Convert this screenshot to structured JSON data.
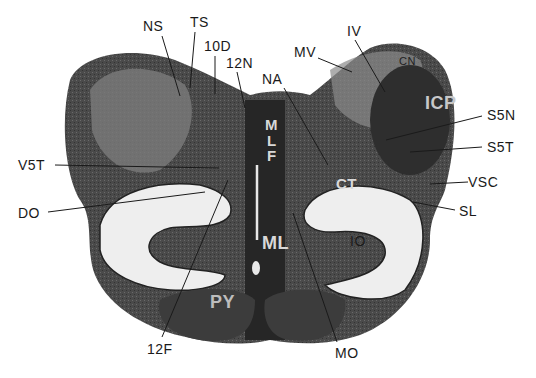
{
  "figure": {
    "external_labels": {
      "NS": "NS",
      "TS": "TS",
      "D10": "10D",
      "N12": "12N",
      "NA": "NA",
      "MV": "MV",
      "IV": "IV",
      "S5N": "S5N",
      "S5T": "S5T",
      "V5T": "V5T",
      "VSC": "VSC",
      "DO": "DO",
      "SL": "SL",
      "F12": "12F",
      "MO": "MO"
    },
    "internal_labels": {
      "CN": "CN",
      "ICP": "ICP",
      "M": "M",
      "L": "L",
      "F": "F",
      "CT": "CT",
      "ML": "ML",
      "IO": "IO",
      "PY": "PY"
    }
  }
}
